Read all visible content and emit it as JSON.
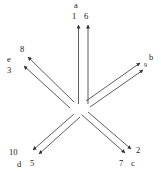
{
  "figure": {
    "type": "radial-arrow-diagram",
    "stroke_color": "#333333",
    "background_color": "#ffffff",
    "center": {
      "x": 80,
      "y": 105
    },
    "branches": [
      {
        "id": "branch-a",
        "group_label": "a",
        "direction": "up",
        "angle_deg": 90,
        "arrow_labels": [
          "1",
          "6"
        ]
      },
      {
        "id": "branch-b",
        "group_label": "b",
        "direction": "up-right",
        "angle_deg": 32,
        "arrow_labels": [
          "9"
        ]
      },
      {
        "id": "branch-c",
        "group_label": "c",
        "direction": "down-right",
        "angle_deg": -40,
        "arrow_labels": [
          "2",
          "7"
        ]
      },
      {
        "id": "branch-d",
        "group_label": "d",
        "direction": "down-left",
        "angle_deg": -140,
        "arrow_labels": [
          "10",
          "5"
        ]
      },
      {
        "id": "branch-e",
        "group_label": "e",
        "direction": "up-left",
        "angle_deg": 148,
        "arrow_labels": [
          "8",
          "3"
        ]
      }
    ],
    "labels": {
      "a": "a",
      "b": "b",
      "c": "c",
      "d": "d",
      "e": "e",
      "n1": "1",
      "n2": "2",
      "n3": "3",
      "n5": "5",
      "n6": "6",
      "n7": "7",
      "n8": "8",
      "n9": "9",
      "n10": "10"
    }
  }
}
